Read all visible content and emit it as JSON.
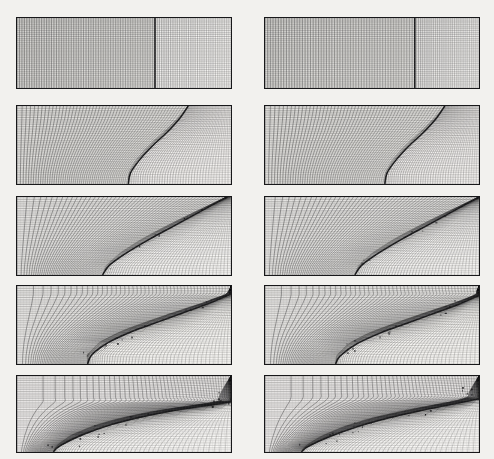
{
  "figure": {
    "title": "",
    "caption": "",
    "background_color": "#f2f1ee",
    "ink_color": "#18181a",
    "panel_fill": "#fbfaf8",
    "rows": 5,
    "columns": 2,
    "panel_width": 216,
    "panel_height": 72,
    "col_x": [
      16,
      264
    ],
    "row_y": [
      17,
      105,
      196,
      285,
      375
    ],
    "row_heights": [
      72,
      80,
      80,
      80,
      78
    ]
  },
  "chart_data": {
    "type": "line",
    "xlabel": "",
    "ylabel": "",
    "grid": true,
    "legend": null,
    "series": [
      {
        "name": "left-column-t1",
        "panel": "r1c1",
        "label": "uniform mesh, planar vertical interface",
        "interface_type": "vertical-line",
        "interface_x_frac": 0.645,
        "mesh_density_left": 56,
        "mesh_density_right": 34,
        "shade_left": 0.42,
        "shade_right": 0.12
      },
      {
        "name": "right-column-t1",
        "panel": "r1c2",
        "label": "uniform mesh, planar vertical interface",
        "interface_type": "vertical-line",
        "interface_x_frac": 0.7,
        "mesh_density_left": 56,
        "mesh_density_right": 34,
        "shade_left": 0.42,
        "shade_right": 0.12
      },
      {
        "name": "left-column-t2",
        "panel": "r2c1",
        "label": "interface bows, mesh compresses near front",
        "interface_type": "bowed-curve",
        "interface_points": [
          [
            0.8,
            0.0
          ],
          [
            0.76,
            0.16
          ],
          [
            0.7,
            0.34
          ],
          [
            0.63,
            0.52
          ],
          [
            0.57,
            0.7
          ],
          [
            0.53,
            0.86
          ],
          [
            0.52,
            1.0
          ]
        ],
        "mesh_density_left": 52,
        "mesh_density_right": 40,
        "shade_left": 0.36,
        "shade_right": 0.1
      },
      {
        "name": "right-column-t2",
        "panel": "r2c2",
        "label": "interface bows, mesh compresses near front",
        "interface_type": "bowed-curve",
        "interface_points": [
          [
            0.84,
            0.0
          ],
          [
            0.8,
            0.16
          ],
          [
            0.74,
            0.34
          ],
          [
            0.67,
            0.52
          ],
          [
            0.61,
            0.7
          ],
          [
            0.57,
            0.86
          ],
          [
            0.56,
            1.0
          ]
        ],
        "mesh_density_left": 52,
        "mesh_density_right": 40,
        "shade_left": 0.36,
        "shade_right": 0.1
      },
      {
        "name": "left-column-t3",
        "panel": "r3c1",
        "label": "interface tilts to a diagonal slip line",
        "interface_type": "diagonal",
        "interface_points": [
          [
            0.98,
            0.0
          ],
          [
            0.86,
            0.18
          ],
          [
            0.74,
            0.36
          ],
          [
            0.62,
            0.54
          ],
          [
            0.51,
            0.72
          ],
          [
            0.43,
            0.88
          ],
          [
            0.4,
            1.0
          ]
        ],
        "mesh_density_left": 50,
        "mesh_density_right": 44,
        "shade_left": 0.3,
        "shade_right": 0.08
      },
      {
        "name": "right-column-t3",
        "panel": "r3c2",
        "label": "interface tilts to a diagonal slip line",
        "interface_type": "diagonal",
        "interface_points": [
          [
            1.0,
            0.0
          ],
          [
            0.88,
            0.18
          ],
          [
            0.76,
            0.36
          ],
          [
            0.64,
            0.54
          ],
          [
            0.53,
            0.72
          ],
          [
            0.45,
            0.88
          ],
          [
            0.42,
            1.0
          ]
        ],
        "mesh_density_left": 50,
        "mesh_density_right": 44,
        "shade_left": 0.3,
        "shade_right": 0.08
      },
      {
        "name": "left-column-t4",
        "panel": "r4c1",
        "label": "roll-up begins, small-scale structure on the front",
        "interface_type": "rollup",
        "interface_points": [
          [
            1.0,
            0.1
          ],
          [
            0.9,
            0.22
          ],
          [
            0.78,
            0.34
          ],
          [
            0.66,
            0.46
          ],
          [
            0.54,
            0.58
          ],
          [
            0.43,
            0.72
          ],
          [
            0.35,
            0.88
          ],
          [
            0.33,
            1.0
          ]
        ],
        "mesh_density_left": 48,
        "mesh_density_right": 46,
        "shade_left": 0.28,
        "shade_right": 0.07
      },
      {
        "name": "right-column-t4",
        "panel": "r4c2",
        "label": "roll-up begins, small-scale structure on the front",
        "interface_type": "rollup",
        "interface_points": [
          [
            1.0,
            0.12
          ],
          [
            0.9,
            0.24
          ],
          [
            0.78,
            0.36
          ],
          [
            0.66,
            0.48
          ],
          [
            0.54,
            0.6
          ],
          [
            0.43,
            0.74
          ],
          [
            0.35,
            0.9
          ],
          [
            0.33,
            1.0
          ]
        ],
        "mesh_density_left": 48,
        "mesh_density_right": 46,
        "shade_left": 0.28,
        "shade_right": 0.07
      },
      {
        "name": "left-column-t5",
        "panel": "r5c1",
        "label": "fully developed mixing layer, mesh fans strongly",
        "interface_type": "mixing-layer",
        "interface_points": [
          [
            1.0,
            0.34
          ],
          [
            0.86,
            0.4
          ],
          [
            0.72,
            0.46
          ],
          [
            0.58,
            0.54
          ],
          [
            0.44,
            0.64
          ],
          [
            0.3,
            0.78
          ],
          [
            0.2,
            0.92
          ],
          [
            0.17,
            1.0
          ]
        ],
        "mesh_density_left": 46,
        "mesh_density_right": 48,
        "shade_left": 0.26,
        "shade_right": 0.06
      },
      {
        "name": "right-column-t5",
        "panel": "r5c2",
        "label": "fully developed mixing layer, mesh fans strongly",
        "interface_type": "mixing-layer",
        "interface_points": [
          [
            1.0,
            0.3
          ],
          [
            0.86,
            0.38
          ],
          [
            0.72,
            0.46
          ],
          [
            0.58,
            0.55
          ],
          [
            0.44,
            0.66
          ],
          [
            0.3,
            0.8
          ],
          [
            0.2,
            0.93
          ],
          [
            0.17,
            1.0
          ]
        ],
        "mesh_density_left": 46,
        "mesh_density_right": 48,
        "shade_left": 0.26,
        "shade_right": 0.06
      }
    ]
  }
}
